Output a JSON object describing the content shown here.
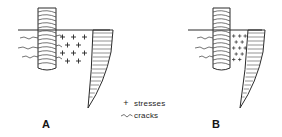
{
  "figure": {
    "title_present": false,
    "background_color": "#ffffff",
    "ink_color": "#2b2b2b",
    "panels": [
      {
        "id": "panel-a",
        "label": "A",
        "label_x": 46,
        "label_y": 128,
        "description": "Threaded bolt through a surface with widely spread stress plus-marks and a hatched wedge stress distribution",
        "ground_line": {
          "x1": 18,
          "y1": 30,
          "x2": 110,
          "y2": 30
        },
        "bolt": {
          "x": 38,
          "y_top": 8,
          "width": 18,
          "height": 60,
          "thread_turns": 14
        },
        "cracks": [
          {
            "y": 38,
            "length": 22
          },
          {
            "y": 48,
            "length": 24
          },
          {
            "y": 57,
            "length": 20
          }
        ],
        "stress_rows": [
          {
            "y": 37,
            "xs": [
              63,
              74,
              85
            ]
          },
          {
            "y": 45,
            "xs": [
              58,
              69,
              80
            ]
          },
          {
            "y": 53,
            "xs": [
              63,
              74,
              85
            ]
          },
          {
            "y": 61,
            "xs": [
              58,
              69,
              80
            ]
          }
        ],
        "wedge": {
          "top_x": 93,
          "top_y": 30,
          "right_x": 113,
          "tip_x": 88,
          "tip_y": 108,
          "hatch_lines": 17
        }
      },
      {
        "id": "panel-b",
        "label": "B",
        "label_x": 216,
        "label_y": 128,
        "description": "Threaded bolt through a surface with stress plus-marks concentrated near the bolt and a hatched wedge stress distribution",
        "ground_line": {
          "x1": 188,
          "y1": 30,
          "x2": 262,
          "y2": 30
        },
        "bolt": {
          "x": 213,
          "y_top": 8,
          "width": 17,
          "height": 60,
          "thread_turns": 14
        },
        "cracks": [
          {
            "y": 38,
            "length": 18
          },
          {
            "y": 48,
            "length": 20
          },
          {
            "y": 57,
            "length": 16
          }
        ],
        "stress_rows": [
          {
            "y": 37,
            "xs": [
              234,
              241,
              248
            ]
          },
          {
            "y": 44,
            "xs": [
              231,
              238,
              245
            ]
          },
          {
            "y": 51,
            "xs": [
              234,
              241,
              248
            ]
          },
          {
            "y": 58,
            "xs": [
              231,
              238,
              245
            ]
          }
        ],
        "wedge": {
          "top_x": 244,
          "top_y": 30,
          "right_x": 265,
          "tip_x": 240,
          "tip_y": 108,
          "hatch_lines": 17
        }
      }
    ]
  },
  "legend": {
    "name": "symbol-legend",
    "x": 123,
    "y": 99,
    "entries": [
      {
        "symbol": "plus-icon",
        "glyph": "+",
        "label": "stresses",
        "y": 103
      },
      {
        "symbol": "wavy-crack-icon",
        "glyph": "〜",
        "label": "cracks",
        "y": 114
      }
    ]
  }
}
